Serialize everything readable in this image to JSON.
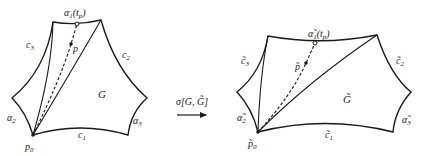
{
  "left_figure": {
    "region_label": "G",
    "edges": {
      "c1": "c",
      "c1_sub": "1",
      "c2": "c",
      "c2_sub": "2",
      "c3": "c",
      "c3_sub": "3"
    },
    "arcs": {
      "a1": "α",
      "a1_sub": "1",
      "a1_arg": "(t",
      "a1_arg_sub": "p",
      "a1_close": ")",
      "a2": "α",
      "a2_sub": "2",
      "a3": "α",
      "a3_sub": "3"
    },
    "point_p": "p",
    "point_p0": "p",
    "point_p0_sub": "0"
  },
  "right_figure": {
    "region_label": "G̃",
    "edges": {
      "c1": "c̃",
      "c1_sub": "1",
      "c2": "c̃",
      "c2_sub": "2",
      "c3": "c̃",
      "c3_sub": "3"
    },
    "arcs": {
      "a1": "α̃",
      "a1_sub": "1",
      "a1_arg": "(t",
      "a1_arg_sub": "p",
      "a1_close": ")",
      "a2": "α̃",
      "a2_sub": "2",
      "a3": "α̃",
      "a3_sub": "3"
    },
    "point_p": "p̃",
    "point_p0": "p̃",
    "point_p0_sub": "0"
  },
  "mapping": {
    "label": "σ[G, G̃]",
    "arrow": "right-arrow"
  },
  "colors": {
    "stroke": "#1a1a1a",
    "background": "#ffffff"
  }
}
